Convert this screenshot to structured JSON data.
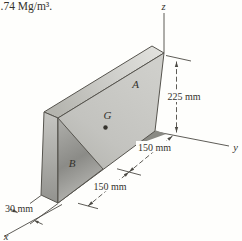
{
  "caption_fragment": ".74 Mg/m³.",
  "figure": {
    "labels": {
      "segment_a": "A",
      "segment_b": "B",
      "centroid": "G"
    },
    "axes": {
      "x": "x",
      "y": "y",
      "z": "z"
    },
    "dimensions": {
      "height": "225 mm",
      "upper_width": "150 mm",
      "lower_width": "150 mm",
      "thickness": "30 mm"
    },
    "colors": {
      "face_light": "#cdcdc9",
      "face_dark": "#8e8e8a",
      "edge": "#56544e",
      "line": "#4c4a44"
    }
  }
}
